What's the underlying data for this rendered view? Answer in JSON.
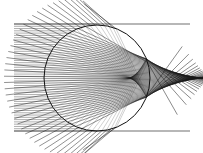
{
  "diagram": {
    "type": "ray-tracing",
    "colors": {
      "background": "#ffffff",
      "ray": "#1a1a1a",
      "circle": "#111111",
      "incoming": "#555555"
    },
    "sphere": {
      "cx": 97,
      "cy": 78,
      "r": 53
    },
    "rays": {
      "x_start": 14,
      "y_top": 24,
      "y_bottom": 131,
      "count": 48,
      "refractive_index": 1.33,
      "exit_length": 60
    },
    "frame_lines": {
      "top_y": 24,
      "bottom_y": 131,
      "x_end": 190
    }
  }
}
